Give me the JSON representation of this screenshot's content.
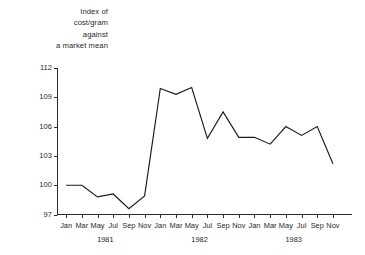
{
  "chart_data": {
    "type": "line",
    "title": "Index of\ncost/gram\nagainst\na market mean",
    "xlabel": "",
    "ylabel": "Index of cost/gram against a market mean",
    "ylim": [
      97,
      112
    ],
    "yticks": [
      97,
      100,
      103,
      106,
      109,
      112
    ],
    "grid": false,
    "legend_position": "none",
    "line_color": "#1a1a1a",
    "x": [
      "Jan 1981",
      "Mar 1981",
      "May 1981",
      "Jul 1981",
      "Sep 1981",
      "Nov 1981",
      "Jan 1982",
      "Mar 1982",
      "May 1982",
      "Jul 1982",
      "Sep 1982",
      "Nov 1982",
      "Jan 1983",
      "Mar 1983",
      "May 1983",
      "Jul 1983",
      "Sep 1983",
      "Nov 1983"
    ],
    "tick_labels": [
      "Jan",
      "Mar",
      "May",
      "Jul",
      "Sep",
      "Nov",
      "Jan",
      "Mar",
      "May",
      "Jul",
      "Sep",
      "Nov",
      "Jan",
      "Mar",
      "May",
      "Jul",
      "Sep",
      "Nov"
    ],
    "year_groups": [
      {
        "label": "1981",
        "start_index": 0,
        "end_index": 5
      },
      {
        "label": "1982",
        "start_index": 6,
        "end_index": 11
      },
      {
        "label": "1983",
        "start_index": 12,
        "end_index": 17
      }
    ],
    "values": [
      100.0,
      100.0,
      98.8,
      99.1,
      97.6,
      98.9,
      109.9,
      109.3,
      110.0,
      104.8,
      107.5,
      104.9,
      104.9,
      104.2,
      106.0,
      105.1,
      106.0,
      102.2
    ]
  }
}
